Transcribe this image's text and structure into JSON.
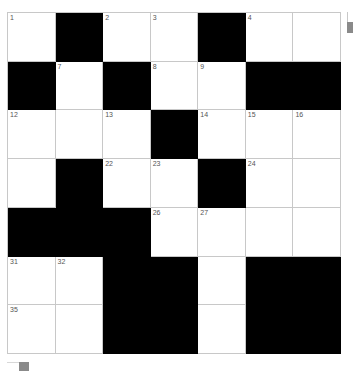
{
  "puzzle": {
    "rows": 7,
    "cols": 7,
    "colors": {
      "block": "#000000",
      "cell": "#ffffff",
      "gridline": "#c8c8c8",
      "number": "#555555"
    },
    "grid": [
      [
        {
          "n": "1"
        },
        {
          "b": true
        },
        {
          "n": "2"
        },
        {
          "n": "3"
        },
        {
          "b": true
        },
        {
          "n": "4"
        },
        {
          "n": ""
        }
      ],
      [
        {
          "b": true
        },
        {
          "n": "7"
        },
        {
          "b": true
        },
        {
          "n": "8"
        },
        {
          "n": "9"
        },
        {
          "b": true
        },
        {
          "b": true
        }
      ],
      [
        {
          "n": "12"
        },
        {
          "n": ""
        },
        {
          "n": "13"
        },
        {
          "b": true
        },
        {
          "n": "14"
        },
        {
          "n": "15"
        },
        {
          "n": "16"
        }
      ],
      [
        {
          "n": ""
        },
        {
          "b": true
        },
        {
          "n": "22"
        },
        {
          "n": "23"
        },
        {
          "b": true
        },
        {
          "n": "24"
        },
        {
          "n": ""
        }
      ],
      [
        {
          "b": true
        },
        {
          "b": true
        },
        {
          "b": true
        },
        {
          "n": "26"
        },
        {
          "n": "27"
        },
        {
          "n": ""
        },
        {
          "n": ""
        }
      ],
      [
        {
          "n": "31"
        },
        {
          "n": "32"
        },
        {
          "b": true
        },
        {
          "b": true
        },
        {
          "n": ""
        },
        {
          "b": true
        },
        {
          "b": true
        }
      ],
      [
        {
          "n": "35"
        },
        {
          "n": ""
        },
        {
          "b": true
        },
        {
          "b": true
        },
        {
          "n": ""
        },
        {
          "b": true
        },
        {
          "b": true
        }
      ]
    ]
  },
  "scrollbars": {
    "vertical": {
      "icon": "scroll-thumb"
    },
    "horizontal": {
      "icon": "scroll-thumb"
    }
  }
}
